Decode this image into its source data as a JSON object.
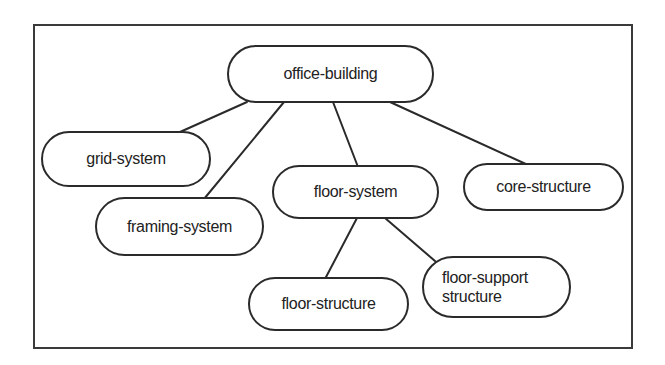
{
  "diagram": {
    "type": "tree",
    "colors": {
      "stroke": "#2a2a2a",
      "text": "#222222",
      "background": "#ffffff"
    },
    "nodes": {
      "office_building": {
        "label": "office-building"
      },
      "grid_system": {
        "label": "grid-system"
      },
      "framing_system": {
        "label": "framing-system"
      },
      "floor_system": {
        "label": "floor-system"
      },
      "core_structure": {
        "label": "core-structure"
      },
      "floor_structure": {
        "label": "floor-structure"
      },
      "floor_support_structure": {
        "label": "floor-support\nstructure"
      }
    },
    "edges": [
      {
        "from": "office-building",
        "to": "grid-system"
      },
      {
        "from": "office-building",
        "to": "framing-system"
      },
      {
        "from": "office-building",
        "to": "floor-system"
      },
      {
        "from": "office-building",
        "to": "core-structure"
      },
      {
        "from": "floor-system",
        "to": "floor-structure"
      },
      {
        "from": "floor-system",
        "to": "floor-support structure"
      }
    ]
  }
}
